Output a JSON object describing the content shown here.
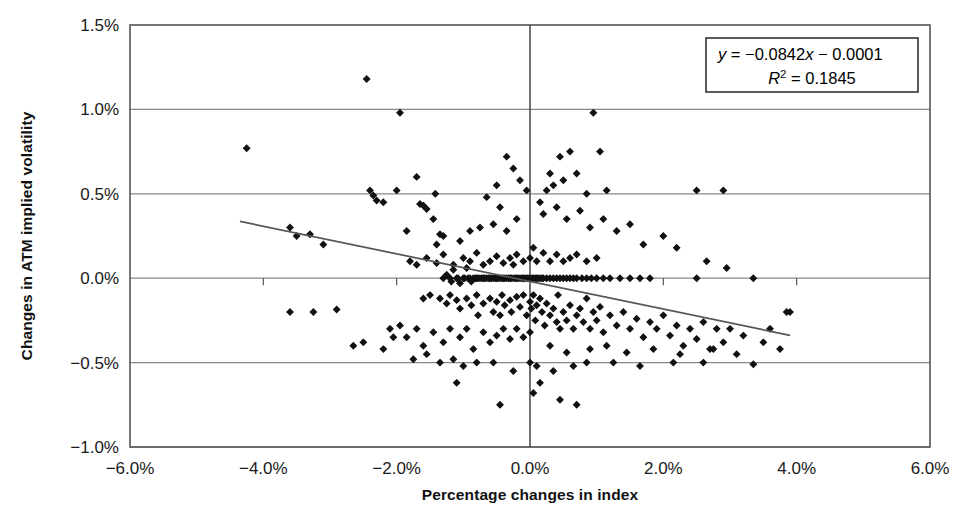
{
  "chart_data": {
    "type": "scatter",
    "title": "",
    "xlabel": "Percentage changes in index",
    "ylabel": "Changes in ATM implied volatility",
    "xlim": [
      -6.0,
      6.0
    ],
    "ylim": [
      -1.0,
      1.5
    ],
    "xticks": [
      -6.0,
      -4.0,
      -2.0,
      0.0,
      2.0,
      4.0,
      6.0
    ],
    "yticks": [
      -1.0,
      -0.5,
      0.0,
      0.5,
      1.0,
      1.5
    ],
    "xtick_labels": [
      "-6.0%",
      "-4.0%",
      "-2.0%",
      "0.0%",
      "2.0%",
      "4.0%",
      "6.0%"
    ],
    "ytick_labels": [
      "-1.0%",
      "-0.5%",
      "0.0%",
      "0.5%",
      "1.0%",
      "1.5%"
    ],
    "grid": "horizontal",
    "legend": "none",
    "marker": "diamond",
    "marker_color": "#111111",
    "annotation_equation": "y = −0.0842x − 0.0001",
    "annotation_r2": "R² = 0.1845",
    "annotation_slope": -0.0842,
    "annotation_intercept": -0.0001,
    "annotation_r2_value": 0.1845,
    "trendline": {
      "x0": -4.35,
      "y0": 0.3365,
      "x1": 3.9,
      "y1": -0.3385
    },
    "points": [
      [
        -4.25,
        0.77
      ],
      [
        -3.6,
        0.3
      ],
      [
        -3.5,
        0.25
      ],
      [
        -3.3,
        0.26
      ],
      [
        -3.1,
        0.2
      ],
      [
        -3.6,
        -0.2
      ],
      [
        -3.25,
        -0.2
      ],
      [
        -2.9,
        -0.185
      ],
      [
        -2.45,
        1.18
      ],
      [
        -2.4,
        0.52
      ],
      [
        -2.35,
        0.49
      ],
      [
        -2.3,
        0.46
      ],
      [
        -2.2,
        0.45
      ],
      [
        -2.0,
        0.52
      ],
      [
        -1.95,
        0.98
      ],
      [
        -1.85,
        0.28
      ],
      [
        -1.7,
        0.6
      ],
      [
        -1.65,
        0.44
      ],
      [
        -1.6,
        0.43
      ],
      [
        -1.55,
        0.41
      ],
      [
        -1.45,
        0.35
      ],
      [
        -1.42,
        0.5
      ],
      [
        -1.4,
        0.2
      ],
      [
        -1.35,
        0.26
      ],
      [
        -1.3,
        0.25
      ],
      [
        -1.3,
        0.0
      ],
      [
        -1.25,
        0.02
      ],
      [
        -1.2,
        0.0
      ],
      [
        -1.18,
        -0.02
      ],
      [
        -1.15,
        0.05
      ],
      [
        -1.1,
        0.0
      ],
      [
        -1.08,
        0.0
      ],
      [
        -1.05,
        -0.03
      ],
      [
        -1.0,
        0.0
      ],
      [
        -0.98,
        0.0
      ],
      [
        -0.95,
        0.06
      ],
      [
        -0.93,
        0.0
      ],
      [
        -0.9,
        0.0
      ],
      [
        -0.88,
        -0.02
      ],
      [
        -0.85,
        0.0
      ],
      [
        -0.82,
        0.0
      ],
      [
        -0.8,
        0.0
      ],
      [
        -0.78,
        0.0
      ],
      [
        -0.75,
        0.0
      ],
      [
        -0.72,
        0.0
      ],
      [
        -0.7,
        0.0
      ],
      [
        -0.68,
        0.0
      ],
      [
        -0.65,
        0.0
      ],
      [
        -0.62,
        0.0
      ],
      [
        -0.6,
        0.0
      ],
      [
        -0.58,
        0.0
      ],
      [
        -0.55,
        0.0
      ],
      [
        -0.52,
        0.0
      ],
      [
        -0.5,
        0.0
      ],
      [
        -0.48,
        0.0
      ],
      [
        -0.45,
        0.0
      ],
      [
        -0.42,
        0.0
      ],
      [
        -0.4,
        0.0
      ],
      [
        -0.38,
        0.0
      ],
      [
        -0.35,
        0.0
      ],
      [
        -0.32,
        0.0
      ],
      [
        -0.3,
        0.0
      ],
      [
        -0.28,
        0.0
      ],
      [
        -0.25,
        0.0
      ],
      [
        -0.22,
        0.0
      ],
      [
        -0.2,
        0.0
      ],
      [
        -0.18,
        0.0
      ],
      [
        -0.15,
        0.0
      ],
      [
        -0.12,
        0.0
      ],
      [
        -0.1,
        0.0
      ],
      [
        -0.08,
        0.0
      ],
      [
        -0.05,
        0.0
      ],
      [
        -0.03,
        0.0
      ],
      [
        0.0,
        0.0
      ],
      [
        0.03,
        0.0
      ],
      [
        0.05,
        0.0
      ],
      [
        0.08,
        0.0
      ],
      [
        0.1,
        0.0
      ],
      [
        0.12,
        0.0
      ],
      [
        0.15,
        0.0
      ],
      [
        0.18,
        0.0
      ],
      [
        0.2,
        0.0
      ],
      [
        0.25,
        0.0
      ],
      [
        0.3,
        0.0
      ],
      [
        0.35,
        0.0
      ],
      [
        0.4,
        0.0
      ],
      [
        0.45,
        0.0
      ],
      [
        0.5,
        0.0
      ],
      [
        0.55,
        0.0
      ],
      [
        0.6,
        0.0
      ],
      [
        0.65,
        0.0
      ],
      [
        0.7,
        0.0
      ],
      [
        0.78,
        0.0
      ],
      [
        0.85,
        0.0
      ],
      [
        0.92,
        0.0
      ],
      [
        1.0,
        0.0
      ],
      [
        1.1,
        0.0
      ],
      [
        1.2,
        0.0
      ],
      [
        1.35,
        0.0
      ],
      [
        1.5,
        0.0
      ],
      [
        1.65,
        0.0
      ],
      [
        1.8,
        0.0
      ],
      [
        2.5,
        0.0
      ],
      [
        3.35,
        0.0
      ],
      [
        -1.6,
        -0.12
      ],
      [
        -1.5,
        -0.1
      ],
      [
        -1.35,
        -0.12
      ],
      [
        -1.25,
        -0.15
      ],
      [
        -1.2,
        -0.1
      ],
      [
        -1.1,
        -0.13
      ],
      [
        -1.05,
        -0.18
      ],
      [
        -0.95,
        -0.12
      ],
      [
        -0.88,
        -0.16
      ],
      [
        -0.8,
        -0.1
      ],
      [
        -0.78,
        -0.22
      ],
      [
        -0.7,
        -0.15
      ],
      [
        -0.6,
        -0.12
      ],
      [
        -0.55,
        -0.2
      ],
      [
        -0.5,
        -0.14
      ],
      [
        -0.45,
        -0.22
      ],
      [
        -0.42,
        -0.1
      ],
      [
        -0.38,
        -0.16
      ],
      [
        -0.3,
        -0.13
      ],
      [
        -0.28,
        -0.2
      ],
      [
        -0.2,
        -0.11
      ],
      [
        -0.15,
        -0.17
      ],
      [
        -0.1,
        -0.1
      ],
      [
        -0.05,
        -0.22
      ],
      [
        0.0,
        -0.14
      ],
      [
        0.02,
        -0.18
      ],
      [
        0.05,
        -0.1
      ],
      [
        0.08,
        -0.25
      ],
      [
        0.1,
        -0.16
      ],
      [
        0.15,
        -0.12
      ],
      [
        0.18,
        -0.2
      ],
      [
        0.22,
        -0.28
      ],
      [
        0.25,
        -0.15
      ],
      [
        0.3,
        -0.22
      ],
      [
        0.35,
        -0.18
      ],
      [
        0.4,
        -0.26
      ],
      [
        0.42,
        -0.1
      ],
      [
        0.45,
        -0.3
      ],
      [
        0.5,
        -0.2
      ],
      [
        0.55,
        -0.25
      ],
      [
        0.6,
        -0.16
      ],
      [
        0.65,
        -0.3
      ],
      [
        0.7,
        -0.22
      ],
      [
        0.75,
        -0.18
      ],
      [
        0.8,
        -0.26
      ],
      [
        0.85,
        -0.12
      ],
      [
        0.9,
        -0.3
      ],
      [
        0.95,
        -0.2
      ],
      [
        1.0,
        -0.25
      ],
      [
        1.05,
        -0.17
      ],
      [
        1.1,
        -0.32
      ],
      [
        1.2,
        -0.22
      ],
      [
        1.3,
        -0.28
      ],
      [
        1.4,
        -0.2
      ],
      [
        1.5,
        -0.3
      ],
      [
        1.6,
        -0.24
      ],
      [
        1.7,
        -0.35
      ],
      [
        1.8,
        -0.26
      ],
      [
        1.9,
        -0.3
      ],
      [
        2.0,
        -0.22
      ],
      [
        2.1,
        -0.34
      ],
      [
        2.2,
        -0.28
      ],
      [
        2.3,
        -0.4
      ],
      [
        2.4,
        -0.3
      ],
      [
        2.5,
        -0.36
      ],
      [
        2.6,
        -0.26
      ],
      [
        2.7,
        -0.42
      ],
      [
        2.8,
        -0.3
      ],
      [
        2.9,
        -0.38
      ],
      [
        3.0,
        -0.3
      ],
      [
        3.1,
        -0.45
      ],
      [
        3.2,
        -0.34
      ],
      [
        3.35,
        -0.51
      ],
      [
        3.5,
        -0.38
      ],
      [
        3.6,
        -0.3
      ],
      [
        3.75,
        -0.42
      ],
      [
        3.85,
        -0.2
      ],
      [
        3.9,
        -0.2
      ],
      [
        -1.8,
        0.1
      ],
      [
        -1.7,
        0.08
      ],
      [
        -1.55,
        0.12
      ],
      [
        -1.4,
        0.09
      ],
      [
        -1.3,
        0.14
      ],
      [
        -1.15,
        0.08
      ],
      [
        -1.0,
        0.12
      ],
      [
        -0.9,
        0.1
      ],
      [
        -0.8,
        0.15
      ],
      [
        -0.7,
        0.08
      ],
      [
        -0.6,
        0.1
      ],
      [
        -0.5,
        0.13
      ],
      [
        -0.4,
        0.09
      ],
      [
        -0.3,
        0.12
      ],
      [
        -0.25,
        0.08
      ],
      [
        -0.2,
        0.14
      ],
      [
        -0.1,
        0.1
      ],
      [
        0.0,
        0.12
      ],
      [
        0.05,
        0.18
      ],
      [
        0.1,
        0.1
      ],
      [
        0.2,
        0.15
      ],
      [
        0.3,
        0.1
      ],
      [
        0.4,
        0.14
      ],
      [
        0.5,
        0.1
      ],
      [
        0.6,
        0.12
      ],
      [
        0.7,
        0.14
      ],
      [
        0.85,
        0.1
      ],
      [
        1.0,
        0.12
      ],
      [
        -2.1,
        -0.3
      ],
      [
        -1.95,
        -0.28
      ],
      [
        -1.85,
        -0.35
      ],
      [
        -1.7,
        -0.3
      ],
      [
        -1.6,
        -0.4
      ],
      [
        -1.45,
        -0.32
      ],
      [
        -1.3,
        -0.38
      ],
      [
        -1.2,
        -0.3
      ],
      [
        -1.05,
        -0.35
      ],
      [
        -0.95,
        -0.3
      ],
      [
        -0.85,
        -0.42
      ],
      [
        -0.7,
        -0.32
      ],
      [
        -0.6,
        -0.38
      ],
      [
        -0.5,
        -0.34
      ],
      [
        -0.4,
        -0.3
      ],
      [
        -0.3,
        -0.36
      ],
      [
        -0.2,
        -0.3
      ],
      [
        -0.1,
        -0.35
      ],
      [
        0.0,
        -0.32
      ],
      [
        -2.65,
        -0.4
      ],
      [
        -2.5,
        -0.38
      ],
      [
        -2.2,
        -0.42
      ],
      [
        -2.05,
        -0.35
      ],
      [
        -1.75,
        -0.48
      ],
      [
        -1.55,
        -0.45
      ],
      [
        -1.35,
        -0.5
      ],
      [
        -1.15,
        -0.48
      ],
      [
        -1.0,
        -0.52
      ],
      [
        -0.8,
        -0.5
      ],
      [
        0.15,
        0.45
      ],
      [
        0.25,
        0.52
      ],
      [
        0.3,
        0.62
      ],
      [
        0.35,
        0.55
      ],
      [
        0.45,
        0.72
      ],
      [
        0.5,
        0.58
      ],
      [
        0.6,
        0.75
      ],
      [
        0.7,
        0.62
      ],
      [
        0.85,
        0.5
      ],
      [
        0.95,
        0.98
      ],
      [
        1.05,
        0.75
      ],
      [
        1.15,
        0.52
      ],
      [
        0.2,
        0.38
      ],
      [
        0.4,
        0.42
      ],
      [
        0.55,
        0.35
      ],
      [
        0.75,
        0.4
      ],
      [
        0.9,
        0.3
      ],
      [
        1.1,
        0.35
      ],
      [
        1.3,
        0.28
      ],
      [
        1.5,
        0.32
      ],
      [
        1.7,
        0.2
      ],
      [
        2.0,
        0.25
      ],
      [
        2.2,
        0.18
      ],
      [
        2.5,
        0.52
      ],
      [
        2.65,
        0.1
      ],
      [
        2.9,
        0.52
      ],
      [
        2.95,
        0.06
      ],
      [
        -0.35,
        0.72
      ],
      [
        -0.25,
        0.65
      ],
      [
        -0.15,
        0.58
      ],
      [
        -0.05,
        0.52
      ],
      [
        -0.5,
        0.55
      ],
      [
        -0.65,
        0.48
      ],
      [
        -0.45,
        0.42
      ],
      [
        -0.75,
        0.3
      ],
      [
        -0.55,
        0.32
      ],
      [
        -0.35,
        0.28
      ],
      [
        -0.2,
        0.35
      ],
      [
        -0.9,
        0.28
      ],
      [
        -1.05,
        0.22
      ],
      [
        0.1,
        -0.52
      ],
      [
        0.35,
        -0.55
      ],
      [
        0.65,
        -0.52
      ],
      [
        0.85,
        -0.5
      ],
      [
        1.25,
        -0.5
      ],
      [
        1.65,
        -0.52
      ],
      [
        2.15,
        -0.5
      ],
      [
        2.6,
        -0.5
      ],
      [
        -0.55,
        -0.5
      ],
      [
        -0.25,
        -0.55
      ],
      [
        0.0,
        -0.5
      ],
      [
        -0.45,
        -0.75
      ],
      [
        0.05,
        -0.68
      ],
      [
        0.45,
        -0.72
      ],
      [
        0.7,
        -0.75
      ],
      [
        -1.1,
        -0.62
      ],
      [
        0.15,
        -0.62
      ],
      [
        0.3,
        -0.4
      ],
      [
        0.55,
        -0.44
      ],
      [
        0.9,
        -0.42
      ],
      [
        1.15,
        -0.4
      ],
      [
        1.45,
        -0.44
      ],
      [
        1.85,
        -0.42
      ],
      [
        2.25,
        -0.45
      ],
      [
        2.75,
        -0.42
      ]
    ]
  },
  "axis": {
    "x_title": "Percentage changes in index",
    "y_title": "Changes in ATM implied volatility"
  },
  "annotation": {
    "line1_lead": "y",
    "line1_rest": " = −0.0842",
    "line1_var": "x",
    "line1_tail": " − 0.0001",
    "line2_lead": "R",
    "line2_sup": "2",
    "line2_rest": " = 0.1845"
  },
  "colors": {
    "marker": "#111111",
    "axis": "#555555",
    "grid": "#888888",
    "trendline": "#555555",
    "frame": "#555555"
  }
}
